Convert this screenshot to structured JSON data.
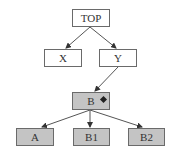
{
  "diagram": {
    "nodes": [
      {
        "id": "top",
        "label": "TOP",
        "shaded": false
      },
      {
        "id": "x",
        "label": "X",
        "shaded": false
      },
      {
        "id": "y",
        "label": "Y",
        "shaded": false
      },
      {
        "id": "b",
        "label": "B",
        "shaded": true,
        "marker": "diamond"
      },
      {
        "id": "a",
        "label": "A",
        "shaded": true
      },
      {
        "id": "b1",
        "label": "B1",
        "shaded": true
      },
      {
        "id": "b2",
        "label": "B2",
        "shaded": true
      }
    ],
    "edges": [
      {
        "from": "top",
        "to": "x"
      },
      {
        "from": "top",
        "to": "y"
      },
      {
        "from": "y",
        "to": "b"
      },
      {
        "from": "b",
        "to": "a"
      },
      {
        "from": "b",
        "to": "b1"
      },
      {
        "from": "b",
        "to": "b2"
      }
    ],
    "colors": {
      "shaded_fill": "#c4c4c4",
      "border": "#6a6a6a",
      "edge": "#444444"
    }
  }
}
